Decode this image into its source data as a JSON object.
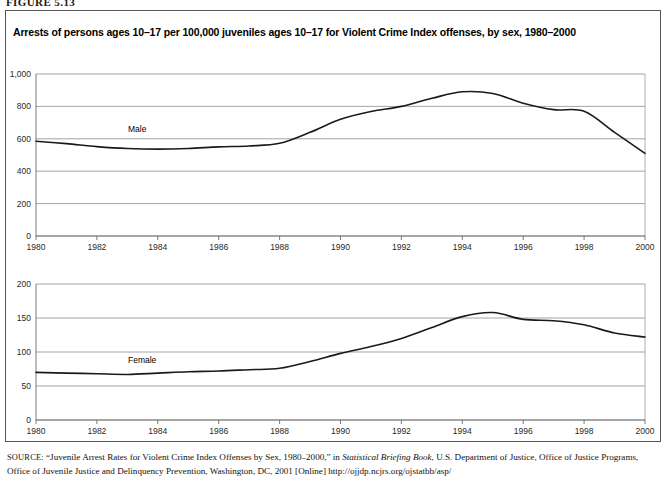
{
  "figure": {
    "number_label": "FIGURE 5.13"
  },
  "chart_title": "Arrests of persons ages 10–17 per 100,000 juveniles ages 10–17 for Violent Crime Index offenses, by sex, 1980–2000",
  "source": {
    "prefix": "SOURCE:",
    "line_a": "“Juvenile Arrest Rates for Violent Crime Index Offenses by Sex, 1980–2000,” in ",
    "italic": "Statistical Briefing Book",
    "line_b": ", U.S. Department of Justice, Office of Justice Programs, Office of Juvenile Justice and Delinquency Prevention, Washington, DC, 2001 [Online] http://ojjdp.ncjrs.org/ojstatbb/asp/"
  },
  "chart_data": [
    {
      "type": "line",
      "id": "male-panel",
      "title": "",
      "series_label": "Male",
      "xlabel": "",
      "ylabel": "",
      "xlim": [
        1980,
        2000
      ],
      "ylim": [
        0,
        1000
      ],
      "grid": true,
      "legend_position": "inline",
      "xticks": [
        "1980",
        "1982",
        "1984",
        "1986",
        "1988",
        "1990",
        "1992",
        "1994",
        "1996",
        "1998",
        "2000"
      ],
      "xtick_values": [
        1980,
        1982,
        1984,
        1986,
        1988,
        1990,
        1992,
        1994,
        1996,
        1998,
        2000
      ],
      "yticks": [
        "0",
        "200",
        "400",
        "600",
        "800",
        "1,000"
      ],
      "ytick_values": [
        0,
        200,
        400,
        600,
        800,
        1000
      ],
      "x": [
        1980,
        1981,
        1982,
        1983,
        1984,
        1985,
        1986,
        1987,
        1988,
        1989,
        1990,
        1991,
        1992,
        1993,
        1994,
        1995,
        1996,
        1997,
        1998,
        1999,
        2000
      ],
      "values": [
        585,
        570,
        552,
        540,
        536,
        540,
        550,
        556,
        572,
        640,
        720,
        768,
        800,
        850,
        890,
        880,
        820,
        780,
        770,
        640,
        510
      ]
    },
    {
      "type": "line",
      "id": "female-panel",
      "title": "",
      "series_label": "Female",
      "xlabel": "",
      "ylabel": "",
      "xlim": [
        1980,
        2000
      ],
      "ylim": [
        0,
        200
      ],
      "grid": true,
      "legend_position": "inline",
      "xticks": [
        "1980",
        "1982",
        "1984",
        "1986",
        "1988",
        "1990",
        "1992",
        "1994",
        "1996",
        "1998",
        "2000"
      ],
      "xtick_values": [
        1980,
        1982,
        1984,
        1986,
        1988,
        1990,
        1992,
        1994,
        1996,
        1998,
        2000
      ],
      "yticks": [
        "0",
        "50",
        "100",
        "150",
        "200"
      ],
      "ytick_values": [
        0,
        50,
        100,
        150,
        200
      ],
      "x": [
        1980,
        1981,
        1982,
        1983,
        1984,
        1985,
        1986,
        1987,
        1988,
        1989,
        1990,
        1991,
        1992,
        1993,
        1994,
        1995,
        1996,
        1997,
        1998,
        1999,
        2000
      ],
      "values": [
        70,
        69,
        68,
        67,
        69,
        71,
        72,
        74,
        76,
        86,
        98,
        108,
        120,
        136,
        152,
        158,
        148,
        146,
        140,
        128,
        122
      ]
    }
  ]
}
